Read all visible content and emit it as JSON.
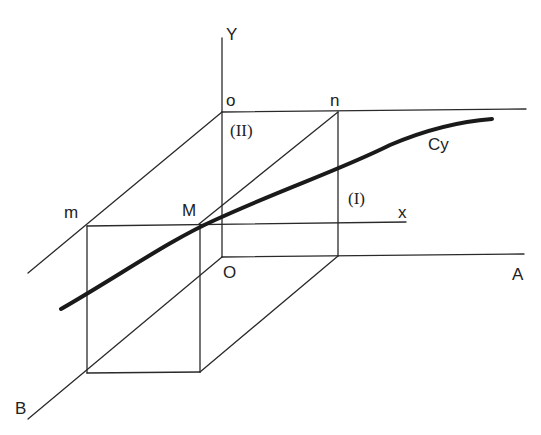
{
  "diagram": {
    "labels": {
      "y_axis": "Y",
      "x_axis": "x",
      "axis_a": "A",
      "axis_b": "B",
      "origin": "O",
      "point_o": "o",
      "point_n": "n",
      "point_m": "m",
      "point_M": "M",
      "region_1": "(I)",
      "region_2": "(II)",
      "curve": "Cy"
    },
    "colors": {
      "line": "#2a2a2a",
      "curve": "#1a1a1a",
      "background": "#ffffff"
    }
  }
}
